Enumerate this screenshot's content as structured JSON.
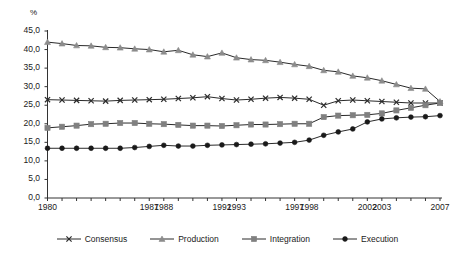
{
  "chart_data": {
    "type": "line",
    "title": "",
    "subtitle": "",
    "xlabel": "",
    "ylabel": "%",
    "ylim": [
      0,
      45
    ],
    "ytick_step": 5,
    "ytick_labels": [
      "0,0",
      "5,0",
      "10,0",
      "15,0",
      "20,0",
      "25,0",
      "30,0",
      "35,0",
      "40,0",
      "45,0"
    ],
    "grid": false,
    "legend_position": "bottom",
    "x": [
      1980,
      1981,
      1982,
      1983,
      1984,
      1985,
      1986,
      1987,
      1988,
      1989,
      1990,
      1991,
      1992,
      1993,
      1994,
      1995,
      1996,
      1997,
      1998,
      1999,
      2000,
      2001,
      2002,
      2003,
      2004,
      2005,
      2006,
      2007
    ],
    "xtick_labels_shown": [
      "1980",
      "1987",
      "1988",
      "1992",
      "1993",
      "1997",
      "1998",
      "2002",
      "2003",
      "2007"
    ],
    "xtick_label_years": [
      1980,
      1987,
      1988,
      1992,
      1993,
      1997,
      1998,
      2002,
      2003,
      2007
    ],
    "series": [
      {
        "name": "Consensus",
        "marker": "x",
        "color": "#2b2b2b",
        "values": [
          26.5,
          26.4,
          26.3,
          26.2,
          26.1,
          26.3,
          26.4,
          26.5,
          26.6,
          26.8,
          27.0,
          27.3,
          26.8,
          26.4,
          26.6,
          26.9,
          27.1,
          26.9,
          26.6,
          25.0,
          26.2,
          26.4,
          26.2,
          26.0,
          25.8,
          25.6,
          25.6,
          25.6
        ]
      },
      {
        "name": "Production",
        "marker": "triangle",
        "color": "#8c8c8c",
        "values": [
          42.0,
          41.6,
          41.1,
          41.0,
          40.6,
          40.5,
          40.2,
          40.0,
          39.4,
          39.8,
          38.6,
          38.1,
          39.1,
          37.8,
          37.3,
          37.1,
          36.6,
          36.0,
          35.5,
          34.4,
          34.0,
          32.9,
          32.4,
          31.6,
          30.6,
          29.6,
          29.4,
          26.0
        ]
      },
      {
        "name": "Integration",
        "marker": "square",
        "color": "#808080",
        "values": [
          18.9,
          19.2,
          19.5,
          19.9,
          20.0,
          20.2,
          20.2,
          20.0,
          19.9,
          19.7,
          19.5,
          19.5,
          19.4,
          19.6,
          19.8,
          19.8,
          19.9,
          20.0,
          20.0,
          21.8,
          22.2,
          22.3,
          22.4,
          22.8,
          23.6,
          24.3,
          25.0,
          25.6
        ]
      },
      {
        "name": "Execution",
        "marker": "circle",
        "color": "#1a1a1a",
        "values": [
          13.4,
          13.4,
          13.4,
          13.4,
          13.4,
          13.4,
          13.6,
          13.9,
          14.2,
          14.0,
          14.0,
          14.2,
          14.3,
          14.4,
          14.5,
          14.6,
          14.8,
          15.0,
          15.6,
          16.9,
          17.8,
          18.6,
          20.5,
          21.3,
          21.6,
          21.8,
          21.9,
          22.2
        ]
      }
    ]
  },
  "axes": {
    "y_unit_label": "%"
  },
  "legend": {
    "items": [
      {
        "label": "Consensus",
        "marker": "x"
      },
      {
        "label": "Production",
        "marker": "triangle"
      },
      {
        "label": "Integration",
        "marker": "square"
      },
      {
        "label": "Execution",
        "marker": "circle"
      }
    ]
  }
}
